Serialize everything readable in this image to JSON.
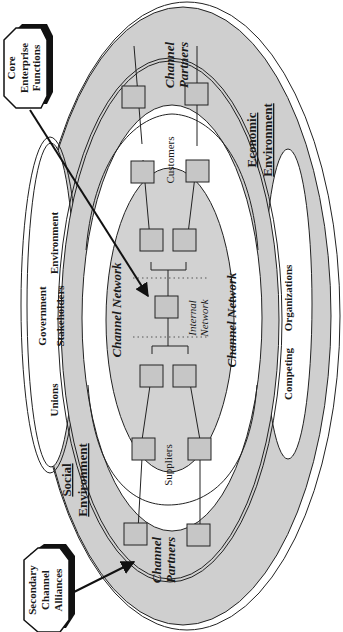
{
  "colors": {
    "background": "#ffffff",
    "gray_fill": "#cfcfcf",
    "inner_gray": "#d2d2d2",
    "node_fill": "#c6c6c6",
    "stroke": "#222222"
  },
  "callouts": {
    "core": {
      "lines": [
        "Core",
        "Enterprise",
        "Functions"
      ]
    },
    "secondary": {
      "lines": [
        "Secondary",
        "Channel",
        "Alliances"
      ]
    }
  },
  "rings": {
    "social_environment": {
      "title": "Social",
      "subtitle": "Environment"
    },
    "economic_environment": {
      "title": "Economic",
      "subtitle": "Environment"
    },
    "channel_partners_top": {
      "line1": "Channel",
      "line2": "Partners"
    },
    "channel_partners_bottom": {
      "line1": "Channel",
      "line2": "Partners"
    },
    "channel_network_left": "Channel Network",
    "channel_network_right": "Channel Network",
    "internal_network": {
      "line1": "Internal",
      "line2": "Network"
    },
    "customers": "Customers",
    "suppliers": "Suppliers"
  },
  "social_items": {
    "unions": "Unions",
    "government": "Government",
    "stakeholders": "Stakeholders",
    "environment": "Environment"
  },
  "economic_items": {
    "competing": "Competing",
    "organizations": "Organizations"
  }
}
